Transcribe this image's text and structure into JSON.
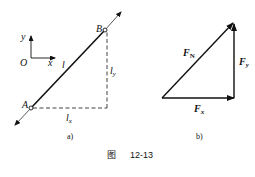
{
  "figure": {
    "caption_prefix": "图",
    "caption_number": "12-13"
  },
  "panel_a": {
    "label": "a)",
    "axes": {
      "x_label": "x",
      "y_label": "y",
      "origin_label": "O"
    },
    "points": {
      "A": "A",
      "B": "B"
    },
    "bar_label": "l",
    "lx_label": "l",
    "lx_sub": "x",
    "ly_label": "l",
    "ly_sub": "y"
  },
  "panel_b": {
    "label": "b)",
    "fn_label": "F",
    "fn_sub": "N",
    "fx_label": "F",
    "fx_sub": "x",
    "fy_label": "F",
    "fy_sub": "y"
  },
  "colors": {
    "line": "#111111",
    "background": "#ffffff"
  }
}
